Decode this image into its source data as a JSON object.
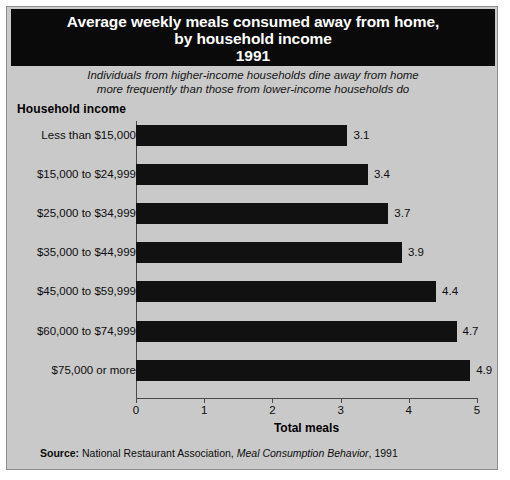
{
  "title": {
    "line1": "Average weekly meals consumed away from home,",
    "line2": "by household income",
    "year": "1991"
  },
  "subtitle": {
    "line1": "Individuals from higher-income households dine away from home",
    "line2": "more frequently than those from lower-income households do"
  },
  "group_label": "Household income",
  "source": {
    "label": "Source:",
    "org": "National Restaurant Association,",
    "publication": "Meal Consumption Behavior",
    "year": ", 1991"
  },
  "colors": {
    "panel": "#c9c9c9",
    "bar": "#111111",
    "title_band": "#0a0a0a",
    "title_text": "#ffffff",
    "axis": "#4a4a4a"
  },
  "chart_data": {
    "type": "bar",
    "orientation": "horizontal",
    "title": "Average weekly meals consumed away from home, by household income 1991",
    "subtitle": "Individuals from higher-income households dine away from home more frequently than those from lower-income households do",
    "xlabel": "Total meals",
    "ylabel": "Household income",
    "xlim": [
      0,
      5
    ],
    "xticks": [
      0,
      1,
      2,
      3,
      4,
      5
    ],
    "xtick_labels": [
      "0",
      "1",
      "2",
      "3",
      "4",
      "5"
    ],
    "grid": false,
    "legend": false,
    "categories": [
      "Less than $15,000",
      "$15,000 to $24,999",
      "$25,000 to $34,999",
      "$35,000 to $44,999",
      "$45,000 to $59,999",
      "$60,000 to $74,999",
      "$75,000 or more"
    ],
    "values": [
      3.1,
      3.4,
      3.7,
      3.9,
      4.4,
      4.7,
      4.9
    ],
    "data_labels": [
      "3.1",
      "3.4",
      "3.7",
      "3.9",
      "4.4",
      "4.7",
      "4.9"
    ]
  }
}
